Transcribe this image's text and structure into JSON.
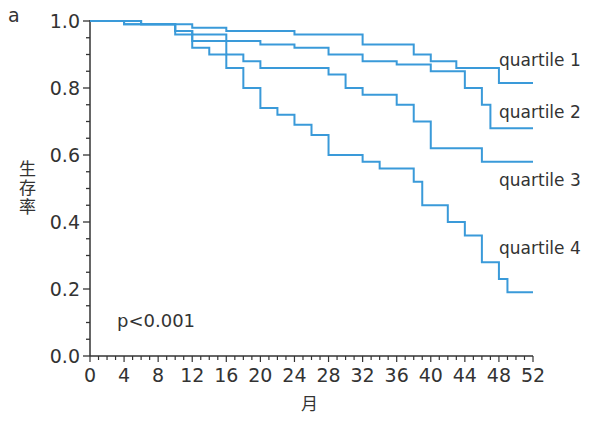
{
  "panel_label": "a",
  "annotation": "p<0.001",
  "chart_data": {
    "type": "line",
    "subtype": "kaplan-meier step curves",
    "title": "",
    "xlabel": "月",
    "ylabel": "生存率",
    "xlim": [
      0,
      52
    ],
    "ylim": [
      0.0,
      1.0
    ],
    "x_ticks": [
      0,
      4,
      8,
      12,
      16,
      20,
      24,
      28,
      32,
      36,
      40,
      44,
      48,
      52
    ],
    "y_ticks": [
      "0.0",
      "0.2",
      "0.4",
      "0.6",
      "0.8",
      "1.0"
    ],
    "grid": false,
    "legend": "inline labels at right",
    "line_color": "#3a9ad9",
    "annotation": "p<0.001",
    "series": [
      {
        "name": "quartile 1",
        "x": [
          0,
          6,
          12,
          16,
          24,
          32,
          38,
          40,
          43,
          48,
          52
        ],
        "y": [
          1.0,
          0.99,
          0.98,
          0.97,
          0.96,
          0.93,
          0.9,
          0.88,
          0.86,
          0.815,
          0.815
        ]
      },
      {
        "name": "quartile 2",
        "x": [
          0,
          6,
          10,
          12,
          16,
          20,
          24,
          28,
          32,
          36,
          40,
          44,
          46,
          47,
          52
        ],
        "y": [
          1.0,
          0.99,
          0.97,
          0.96,
          0.94,
          0.93,
          0.92,
          0.9,
          0.88,
          0.87,
          0.85,
          0.8,
          0.75,
          0.68,
          0.68
        ]
      },
      {
        "name": "quartile 3",
        "x": [
          0,
          4,
          10,
          12,
          16,
          18,
          20,
          28,
          30,
          32,
          36,
          38,
          40,
          46,
          52
        ],
        "y": [
          1.0,
          0.99,
          0.97,
          0.94,
          0.9,
          0.88,
          0.86,
          0.84,
          0.8,
          0.78,
          0.75,
          0.7,
          0.62,
          0.58,
          0.58
        ]
      },
      {
        "name": "quartile 4",
        "x": [
          0,
          4,
          10,
          12,
          14,
          16,
          18,
          20,
          22,
          24,
          26,
          28,
          32,
          34,
          38,
          39,
          42,
          44,
          46,
          48,
          49,
          52
        ],
        "y": [
          1.0,
          0.99,
          0.96,
          0.92,
          0.9,
          0.86,
          0.8,
          0.74,
          0.72,
          0.69,
          0.66,
          0.6,
          0.58,
          0.56,
          0.52,
          0.45,
          0.4,
          0.36,
          0.28,
          0.23,
          0.19,
          0.19
        ]
      }
    ]
  }
}
